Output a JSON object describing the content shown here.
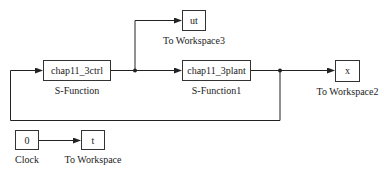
{
  "diagram": {
    "type": "simulink-block-diagram",
    "colors": {
      "line": "#222222",
      "block_border": "#333333",
      "background": "#ffffff"
    },
    "blocks": [
      {
        "id": "ctrl",
        "text": "chap11_3ctrl",
        "caption": "S-Function",
        "x": 43,
        "y": 60,
        "w": 68,
        "h": 21
      },
      {
        "id": "plant",
        "text": "chap11_3plant",
        "caption": "S-Function1",
        "x": 182,
        "y": 60,
        "w": 69,
        "h": 21
      },
      {
        "id": "ut",
        "text": "ut",
        "caption": "To Workspace3",
        "x": 182,
        "y": 10,
        "w": 24,
        "h": 21
      },
      {
        "id": "x",
        "text": "x",
        "caption": "To Workspace2",
        "x": 335,
        "y": 60,
        "w": 25,
        "h": 22
      },
      {
        "id": "clock",
        "text": "0",
        "caption": "Clock",
        "x": 15,
        "y": 130,
        "w": 24,
        "h": 20
      },
      {
        "id": "t",
        "text": "t",
        "caption": "To Workspace",
        "x": 81,
        "y": 130,
        "w": 24,
        "h": 20
      }
    ]
  }
}
